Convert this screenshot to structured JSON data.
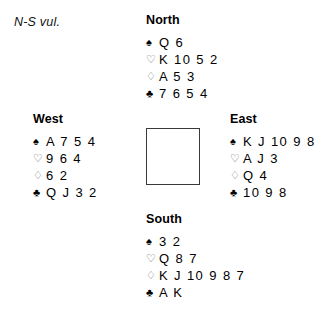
{
  "vulnerability": "N-S vul.",
  "suit_symbols": {
    "spades": "♠",
    "hearts": "♡",
    "diamonds": "♢",
    "clubs": "♣"
  },
  "hands": {
    "north": {
      "label": "North",
      "spades": "Q 6",
      "hearts": "K 10 5 2",
      "diamonds": "A 5 3",
      "clubs": "7 6 5 4"
    },
    "west": {
      "label": "West",
      "spades": "A 7 5 4",
      "hearts": "9 6 4",
      "diamonds": "6 2",
      "clubs": "Q J 3 2"
    },
    "east": {
      "label": "East",
      "spades": "K J 10 9 8",
      "hearts": "A J 3",
      "diamonds": "Q 4",
      "clubs": "10 9 8"
    },
    "south": {
      "label": "South",
      "spades": "3 2",
      "hearts": "Q 8 7",
      "diamonds": "K J 10 9 8 7",
      "clubs": "A K"
    }
  }
}
